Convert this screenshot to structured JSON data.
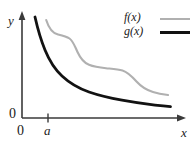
{
  "figure": {
    "background_color": "#ffffff"
  },
  "axes": {
    "y_label": "y",
    "x_label": "x",
    "y_origin_label": "0",
    "x_origin_label": "0",
    "axis_color": "#3a3a3a",
    "tick_label_a": "a"
  },
  "legend": {
    "items": [
      {
        "label": "f(x)",
        "color": "#b0b0b0",
        "width": 2
      },
      {
        "label": "g(x)",
        "color": "#121212",
        "width": 3
      }
    ]
  },
  "chart_data": {
    "type": "line",
    "title": "",
    "xlabel": "x",
    "ylabel": "y",
    "xlim": [
      0,
      10
    ],
    "ylim": [
      0,
      10
    ],
    "grid": false,
    "legend_position": "top-right",
    "annotations": [
      {
        "text": "a",
        "axis": "x",
        "value": 1.3,
        "type": "tick"
      },
      {
        "text": "0",
        "axis": "x",
        "value": 0,
        "type": "origin"
      },
      {
        "text": "0",
        "axis": "y",
        "value": 0,
        "type": "origin"
      }
    ],
    "series": [
      {
        "name": "f(x)",
        "color": "#b0b0b0",
        "linewidth": 2,
        "x": [
          1.55,
          1.9,
          2.4,
          2.9,
          3.35,
          3.8,
          4.3,
          4.8,
          5.3,
          5.8,
          6.4,
          7.0,
          7.6,
          8.2,
          8.8,
          9.4,
          9.9
        ],
        "y": [
          9.3,
          8.4,
          7.9,
          7.75,
          7.6,
          7.1,
          6.1,
          5.0,
          4.3,
          4.0,
          3.9,
          3.85,
          3.6,
          3.0,
          2.5,
          2.25,
          2.15
        ]
      },
      {
        "name": "g(x)",
        "color": "#121212",
        "linewidth": 3,
        "x": [
          1.15,
          1.4,
          1.7,
          2.1,
          2.6,
          3.2,
          3.9,
          4.7,
          5.6,
          6.5,
          7.4,
          8.3,
          9.2,
          9.95
        ],
        "y": [
          9.6,
          8.2,
          6.8,
          5.5,
          4.5,
          3.75,
          3.2,
          2.8,
          2.45,
          2.2,
          1.95,
          1.8,
          1.65,
          1.55
        ]
      }
    ]
  }
}
